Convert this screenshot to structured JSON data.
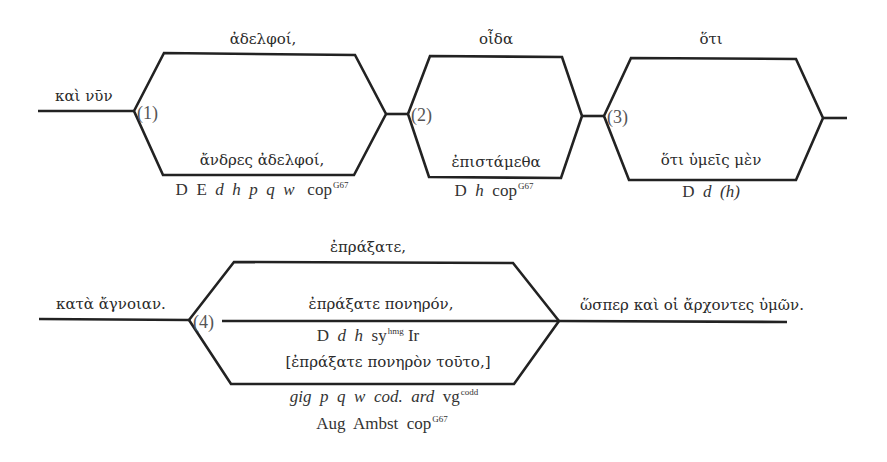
{
  "diagram": {
    "stroke_color": "#222222",
    "text_color": "#2a2a2a"
  },
  "row1": {
    "lead": "καὶ νῦν",
    "units": [
      {
        "number": "(1)",
        "top_reading": "ἀδελφοί,",
        "bottom_reading": "ἄνδρες ἀδελφοί,",
        "witnesses": {
          "parts": [
            "D",
            "E",
            "d",
            "h",
            "p",
            "q",
            "w",
            "cop"
          ],
          "sup": "G67"
        }
      },
      {
        "number": "(2)",
        "top_reading": "οἶδα",
        "bottom_reading": "ἐπιστάμεθα",
        "witnesses": {
          "parts": [
            "D",
            "h",
            "cop"
          ],
          "sup": "G67"
        }
      },
      {
        "number": "(3)",
        "top_reading": "ὅτι",
        "bottom_reading": "ὅτι ὑμεῖς μὲν",
        "witnesses": {
          "parts": [
            "D",
            "d",
            "(h)"
          ]
        }
      }
    ]
  },
  "row2": {
    "lead": "κατὰ ἄγνοιαν.",
    "trail": "ὥσπερ καὶ οἱ ἄρχοντες ὑμῶν.",
    "unit": {
      "number": "(4)",
      "top_reading": "ἐπράξατε,",
      "middle_reading": "ἐπράξατε πονηρόν,",
      "middle_witnesses": {
        "parts": [
          "D",
          "d",
          "h",
          "sy",
          "Ir"
        ],
        "sup": "hmg"
      },
      "bottom_reading": "[ἐπράξατε πονηρὸν τοῦτο,]",
      "bottom_witnesses_line1": {
        "parts": [
          "gig",
          "p",
          "q",
          "w",
          "cod.",
          "ard",
          "vg"
        ],
        "sup": "codd"
      },
      "bottom_witnesses_line2": {
        "parts": [
          "Aug",
          "Ambst",
          "cop"
        ],
        "sup": "G67"
      }
    }
  }
}
